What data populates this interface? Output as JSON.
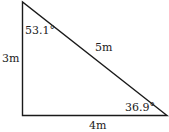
{
  "diagram": {
    "type": "right-triangle",
    "sides": {
      "vertical": "3m",
      "horizontal": "4m",
      "hypotenuse": "5m"
    },
    "angles": {
      "top": "53.1°",
      "bottom_right": "36.9°"
    },
    "stroke_color": "#1a1a1a"
  }
}
